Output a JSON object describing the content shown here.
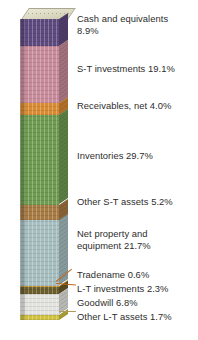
{
  "chart_data": {
    "type": "bar",
    "subtype": "stacked-column-3d",
    "title": "",
    "xlabel": "",
    "ylabel": "",
    "ylim": [
      0,
      100
    ],
    "unit": "percent",
    "total": 100.0,
    "grid": false,
    "legend_position": "right-inline-annotations",
    "categories": [
      "Total assets"
    ],
    "series": [
      {
        "name": "Cash and equivalents",
        "value": 8.9,
        "color": "#5f4a80"
      },
      {
        "name": "S-T investments",
        "value": 19.1,
        "color": "#c98c9c"
      },
      {
        "name": "Receivables, net",
        "value": 4.0,
        "color": "#d98b33"
      },
      {
        "name": "Inventories",
        "value": 29.7,
        "color": "#6f9b52"
      },
      {
        "name": "Other S-T assets",
        "value": 5.2,
        "color": "#a87a44"
      },
      {
        "name": "Net property and equipment",
        "value": 21.7,
        "color": "#a8bfc2"
      },
      {
        "name": "Tradename",
        "value": 0.6,
        "color": "#d8a33c"
      },
      {
        "name": "L-T investments",
        "value": 2.3,
        "color": "#6b5d2c"
      },
      {
        "name": "Goodwill",
        "value": 6.8,
        "color": "#e3e3e0"
      },
      {
        "name": "Other L-T assets",
        "value": 1.7,
        "color": "#cfc23f"
      }
    ],
    "annotations": [
      {
        "id": "cash",
        "text": "Cash and equivalents\n8.9%",
        "leader": false
      },
      {
        "id": "st-inv",
        "text": "S-T investments 19.1%",
        "leader": false
      },
      {
        "id": "receivables",
        "text": "Receivables, net 4.0%",
        "leader": false
      },
      {
        "id": "inventories",
        "text": "Inventories 29.7%",
        "leader": false
      },
      {
        "id": "other-st",
        "text": "Other S-T assets 5.2%",
        "leader": false
      },
      {
        "id": "ppe",
        "text": "Net property and\nequipment 21.7%",
        "leader": false
      },
      {
        "id": "tradename",
        "text": "Tradename 0.6%",
        "leader": true
      },
      {
        "id": "lt-inv",
        "text": "L-T investments 2.3%",
        "leader": true
      },
      {
        "id": "goodwill",
        "text": "Goodwill 6.8%",
        "leader": false
      },
      {
        "id": "other-lt",
        "text": "Other L-T assets 1.7%",
        "leader": true
      }
    ]
  },
  "labels": {
    "cash": "Cash and equivalents\n8.9%",
    "st_inv": "S-T investments 19.1%",
    "receivables": "Receivables, net 4.0%",
    "inventories": "Inventories 29.7%",
    "other_st": "Other S-T assets 5.2%",
    "ppe": "Net property and\nequipment 21.7%",
    "tradename": "Tradename 0.6%",
    "lt_inv": "L-T investments 2.3%",
    "goodwill": "Goodwill 6.8%",
    "other_lt": "Other L-T assets 1.7%"
  }
}
